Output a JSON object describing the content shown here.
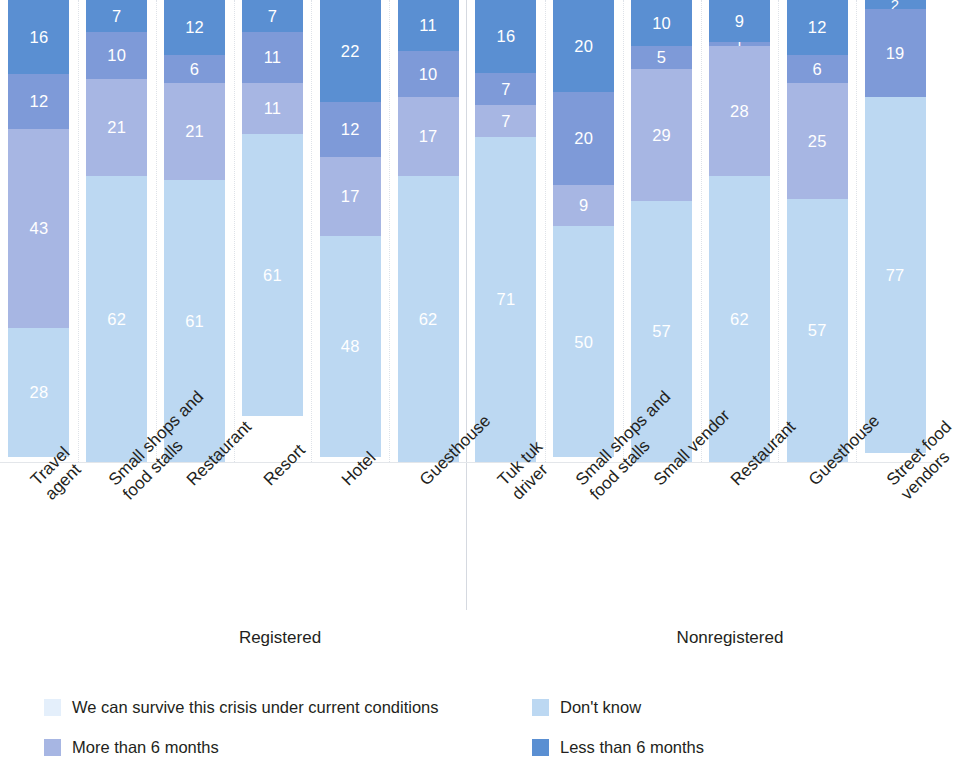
{
  "chart_data": {
    "type": "bar",
    "subtype": "stacked-100-percent-vertical",
    "title": "",
    "subtitle": "",
    "xlabel": "",
    "ylabel": "",
    "ylim": [
      0,
      100
    ],
    "grid": true,
    "legend_position": "bottom",
    "stack_order_bottom_to_top": [
      "We can survive this crisis under current conditions",
      "Don't know",
      "More than 6 months",
      "Less than 6 months"
    ],
    "series": [
      {
        "name": "We can survive this crisis under current conditions",
        "color": "#bcd8f2",
        "values": [
          28,
          62,
          61,
          61,
          48,
          62,
          71,
          50,
          57,
          62,
          57,
          77
        ]
      },
      {
        "name": "Don't know",
        "color": "#a7b6e3",
        "values": [
          43,
          21,
          21,
          11,
          17,
          17,
          7,
          9,
          29,
          28,
          25,
          0
        ]
      },
      {
        "name": "More than 6 months",
        "color": "#7e9ad8",
        "values": [
          12,
          10,
          6,
          11,
          12,
          10,
          7,
          20,
          5,
          1,
          6,
          19
        ]
      },
      {
        "name": "Less than 6 months",
        "color": "#5a8fd2",
        "values": [
          16,
          7,
          12,
          7,
          22,
          11,
          16,
          20,
          10,
          9,
          12,
          2
        ]
      }
    ],
    "categories": [
      "Travel\nagent",
      "Small shops and\nfood stalls",
      "Restaurant",
      "Resort",
      "Hotel",
      "Guesthouse",
      "Tuk tuk\ndriver",
      "Small shops and\nfood stalls",
      "Small vendor",
      "Restaurant",
      "Guesthouse",
      "Street food\nvendors"
    ],
    "groups": [
      {
        "label": "Registered",
        "categories": [
          "Travel agent",
          "Small shops and food stalls",
          "Restaurant",
          "Resort",
          "Hotel",
          "Guesthouse"
        ]
      },
      {
        "label": "Nonregistered",
        "categories": [
          "Tuk tuk driver",
          "Small shops and food stalls",
          "Small vendor",
          "Restaurant",
          "Guesthouse",
          "Street food vendors"
        ]
      }
    ],
    "bars": [
      {
        "category": "Travel agent",
        "group": "Registered",
        "segments": [
          {
            "label": "Less than 6 months",
            "value": 16
          },
          {
            "label": "More than 6 months",
            "value": 12
          },
          {
            "label": "Don't know",
            "value": 43
          },
          {
            "label": "We can survive this crisis under current conditions",
            "value": 28
          }
        ]
      },
      {
        "category": "Small shops and food stalls",
        "group": "Registered",
        "segments": [
          {
            "label": "Less than 6 months",
            "value": 7
          },
          {
            "label": "More than 6 months",
            "value": 10
          },
          {
            "label": "Don't know",
            "value": 21
          },
          {
            "label": "We can survive this crisis under current conditions",
            "value": 62
          }
        ]
      },
      {
        "category": "Restaurant",
        "group": "Registered",
        "segments": [
          {
            "label": "Less than 6 months",
            "value": 12
          },
          {
            "label": "More than 6 months",
            "value": 6
          },
          {
            "label": "Don't know",
            "value": 21
          },
          {
            "label": "We can survive this crisis under current conditions",
            "value": 61
          }
        ]
      },
      {
        "category": "Resort",
        "group": "Registered",
        "segments": [
          {
            "label": "Less than 6 months",
            "value": 7
          },
          {
            "label": "More than 6 months",
            "value": 11
          },
          {
            "label": "Don't know",
            "value": 11
          },
          {
            "label": "We can survive this crisis under current conditions",
            "value": 61
          }
        ]
      },
      {
        "category": "Hotel",
        "group": "Registered",
        "segments": [
          {
            "label": "Less than 6 months",
            "value": 22
          },
          {
            "label": "More than 6 months",
            "value": 12
          },
          {
            "label": "Don't know",
            "value": 17
          },
          {
            "label": "We can survive this crisis under current conditions",
            "value": 48
          }
        ]
      },
      {
        "category": "Guesthouse",
        "group": "Registered",
        "segments": [
          {
            "label": "Less than 6 months",
            "value": 11
          },
          {
            "label": "More than 6 months",
            "value": 10
          },
          {
            "label": "Don't know",
            "value": 17
          },
          {
            "label": "We can survive this crisis under current conditions",
            "value": 62
          }
        ]
      },
      {
        "category": "Tuk tuk driver",
        "group": "Nonregistered",
        "segments": [
          {
            "label": "Less than 6 months",
            "value": 16
          },
          {
            "label": "More than 6 months",
            "value": 7
          },
          {
            "label": "Don't know",
            "value": 7
          },
          {
            "label": "We can survive this crisis under current conditions",
            "value": 71
          }
        ]
      },
      {
        "category": "Small shops and food stalls",
        "group": "Nonregistered",
        "segments": [
          {
            "label": "Less than 6 months",
            "value": 20
          },
          {
            "label": "More than 6 months",
            "value": 20
          },
          {
            "label": "Don't know",
            "value": 9
          },
          {
            "label": "We can survive this crisis under current conditions",
            "value": 50
          }
        ]
      },
      {
        "category": "Small vendor",
        "group": "Nonregistered",
        "segments": [
          {
            "label": "Less than 6 months",
            "value": 10
          },
          {
            "label": "More than 6 months",
            "value": 5
          },
          {
            "label": "Don't know",
            "value": 29
          },
          {
            "label": "We can survive this crisis under current conditions",
            "value": 57
          }
        ]
      },
      {
        "category": "Restaurant",
        "group": "Nonregistered",
        "segments": [
          {
            "label": "Less than 6 months",
            "value": 9
          },
          {
            "label": "More than 6 months",
            "value": 1
          },
          {
            "label": "Don't know",
            "value": 28
          },
          {
            "label": "We can survive this crisis under current conditions",
            "value": 62
          }
        ]
      },
      {
        "category": "Guesthouse",
        "group": "Nonregistered",
        "segments": [
          {
            "label": "Less than 6 months",
            "value": 12
          },
          {
            "label": "More than 6 months",
            "value": 6
          },
          {
            "label": "Don't know",
            "value": 25
          },
          {
            "label": "We can survive this crisis under current conditions",
            "value": 57
          }
        ]
      },
      {
        "category": "Street food vendors",
        "group": "Nonregistered",
        "segments": [
          {
            "label": "Less than 6 months",
            "value": 2
          },
          {
            "label": "More than 6 months",
            "value": 19
          },
          {
            "label": "We can survive this crisis under current conditions",
            "value": 77
          }
        ]
      }
    ],
    "legend": [
      {
        "label": "We can survive this crisis under current conditions",
        "color": "#e4effb"
      },
      {
        "label": "Don't know",
        "color": "#bcd8f2"
      },
      {
        "label": "More than 6 months",
        "color": "#a7b6e3"
      },
      {
        "label": "Less than 6 months",
        "color": "#5a8fd2"
      }
    ]
  },
  "colors": {
    "survive": "#bcd8f2",
    "dont_know": "#a7b6e3",
    "more_than_6": "#7e9ad8",
    "less_than_6": "#5a8fd2",
    "gridline": "#d9dde4",
    "text": "#231f20"
  }
}
